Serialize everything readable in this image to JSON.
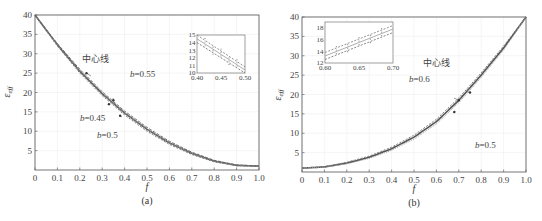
{
  "chart_data": [
    {
      "panel": "(a)",
      "type": "line",
      "title": "",
      "caption": "(a)",
      "xlabel": "f",
      "ylabel": "ε_eff",
      "xlim": [
        0,
        1.0
      ],
      "ylim": [
        0,
        40
      ],
      "xticks": [
        "0",
        "0.1",
        "0.2",
        "0.3",
        "0.4",
        "0.5",
        "0.6",
        "0.7",
        "0.8",
        "0.9",
        "1.0"
      ],
      "yticks": [
        "5",
        "10",
        "15",
        "20",
        "25",
        "30",
        "35",
        "40"
      ],
      "grid": true,
      "x": [
        0,
        0.1,
        0.2,
        0.3,
        0.4,
        0.5,
        0.6,
        0.7,
        0.8,
        0.9,
        1.0
      ],
      "series": [
        {
          "name": "中心线",
          "values": [
            40,
            32.3,
            25.5,
            19.7,
            14.7,
            10.5,
            7.0,
            4.3,
            2.3,
            1.2,
            1.0
          ]
        },
        {
          "name": "b=0.45",
          "values": [
            40,
            32.0,
            25.0,
            19.2,
            14.2,
            10.0,
            6.6,
            4.0,
            2.1,
            1.1,
            1.0
          ]
        },
        {
          "name": "b=0.5",
          "values": [
            40,
            32.3,
            25.5,
            19.7,
            14.7,
            10.5,
            7.0,
            4.3,
            2.3,
            1.2,
            1.0
          ]
        },
        {
          "name": "b=0.55",
          "values": [
            40,
            32.6,
            26.0,
            20.2,
            15.2,
            11.0,
            7.4,
            4.6,
            2.5,
            1.3,
            1.0
          ]
        }
      ],
      "annotations": [
        {
          "text": "中心线",
          "x": 0.23,
          "y": 25
        },
        {
          "text": "b=0.55",
          "x": 0.35,
          "y": 18
        },
        {
          "text": "b=0.45",
          "x": 0.33,
          "y": 17
        },
        {
          "text": "b=0.5",
          "x": 0.38,
          "y": 14
        }
      ],
      "inset": {
        "xlim": [
          0.4,
          0.5
        ],
        "ylim": [
          10,
          15
        ],
        "xticks": [
          "0.40",
          "0.45",
          "0.50"
        ],
        "yticks": [
          "10",
          "11",
          "12",
          "13",
          "14",
          "15"
        ],
        "series": [
          {
            "name": "b=0.55",
            "x": [
              0.4,
              0.5
            ],
            "y": [
              15.0,
              10.8
            ]
          },
          {
            "name": "中心线",
            "x": [
              0.4,
              0.5
            ],
            "y": [
              14.5,
              10.4
            ]
          },
          {
            "name": "b=0.45",
            "x": [
              0.4,
              0.5
            ],
            "y": [
              14.0,
              10.0
            ]
          }
        ]
      }
    },
    {
      "panel": "(b)",
      "type": "line",
      "title": "",
      "caption": "(b)",
      "xlabel": "f",
      "ylabel": "ε_eff",
      "xlim": [
        0,
        1.0
      ],
      "ylim": [
        0,
        40
      ],
      "xticks": [
        "0",
        "0.1",
        "0.2",
        "0.3",
        "0.4",
        "0.5",
        "0.6",
        "0.7",
        "0.8",
        "0.9",
        "1.0"
      ],
      "yticks": [
        "5",
        "10",
        "15",
        "20",
        "25",
        "30",
        "35",
        "40"
      ],
      "grid": true,
      "x": [
        0,
        0.1,
        0.2,
        0.3,
        0.4,
        0.5,
        0.6,
        0.7,
        0.8,
        0.9,
        1.0
      ],
      "series": [
        {
          "name": "中心线",
          "values": [
            1.0,
            1.3,
            2.3,
            3.8,
            6.0,
            9.0,
            13.0,
            18.5,
            25.0,
            32.0,
            40
          ]
        },
        {
          "name": "b=0.6",
          "values": [
            1.0,
            1.4,
            2.5,
            4.1,
            6.4,
            9.5,
            13.6,
            19.1,
            25.6,
            32.5,
            40
          ]
        },
        {
          "name": "b=0.5",
          "values": [
            1.0,
            1.2,
            2.1,
            3.5,
            5.6,
            8.5,
            12.4,
            17.9,
            24.4,
            31.5,
            40
          ]
        }
      ],
      "annotations": [
        {
          "text": "中心线",
          "x": 0.75,
          "y": 20.5
        },
        {
          "text": "b=0.6",
          "x": 0.7,
          "y": 18.5
        },
        {
          "text": "b=0.5",
          "x": 0.68,
          "y": 15.5
        }
      ],
      "inset": {
        "xlim": [
          0.6,
          0.7
        ],
        "ylim": [
          12,
          19
        ],
        "xticks": [
          "0.60",
          "0.65",
          "0.70"
        ],
        "yticks": [
          "12",
          "14",
          "16",
          "18"
        ],
        "series": [
          {
            "name": "b=0.6",
            "x": [
              0.6,
              0.7
            ],
            "y": [
              13.8,
              18.4
            ]
          },
          {
            "name": "中心线",
            "x": [
              0.6,
              0.7
            ],
            "y": [
              13.2,
              17.8
            ]
          },
          {
            "name": "b=0.5",
            "x": [
              0.6,
              0.7
            ],
            "y": [
              12.6,
              17.2
            ]
          }
        ]
      }
    }
  ]
}
